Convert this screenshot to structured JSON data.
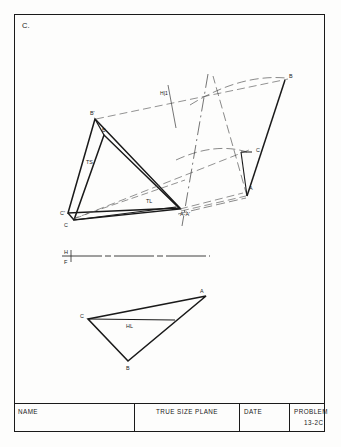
{
  "sheet": {
    "problem_letter": "C."
  },
  "title_block": {
    "name_label": "NAME",
    "plane_label": "TRUE SIZE PLANE",
    "date_label": "DATE",
    "problem_label": "PROBLEM",
    "problem_number": "13-2C"
  },
  "reference_line": {
    "upper_label": "H",
    "lower_label": "F"
  },
  "fold_line": {
    "label": "H|1"
  },
  "top_view": {
    "labels": {
      "b_prime": "B'",
      "b": "B",
      "c_prime": "C'",
      "c": "C",
      "a_a_prime": "A-A'",
      "true_size": "TS",
      "true_length": "TL"
    }
  },
  "auxiliary_view": {
    "labels": {
      "a": "A",
      "b": "B",
      "c": "C"
    }
  },
  "front_view": {
    "labels": {
      "a": "A",
      "b": "B",
      "c": "C",
      "horizontal_line": "HL"
    }
  },
  "colors": {
    "ink": "#1a1a1a",
    "construction": "#3a3a3a",
    "paper": "#fdfdfc"
  }
}
